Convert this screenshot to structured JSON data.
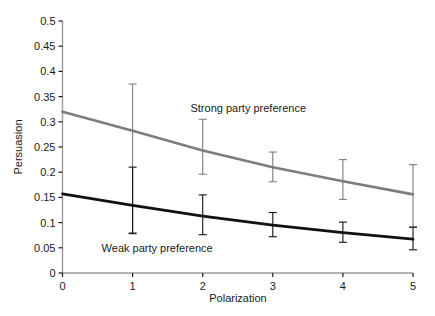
{
  "chart_data": {
    "type": "line",
    "title": "",
    "subtitle": "",
    "xlabel": "Polarization",
    "ylabel": "Persuasion",
    "x": [
      0,
      1,
      2,
      3,
      4,
      5
    ],
    "xlim": [
      0,
      5
    ],
    "ylim": [
      0,
      0.5
    ],
    "xticks": [
      "0",
      "1",
      "2",
      "3",
      "4",
      "5"
    ],
    "yticks": [
      "0",
      "0.05",
      "0.1",
      "0.15",
      "0.2",
      "0.25",
      "0.3",
      "0.35",
      "0.4",
      "0.45",
      "0.5"
    ],
    "ytick_values": [
      0,
      0.05,
      0.1,
      0.15,
      0.2,
      0.25,
      0.3,
      0.35,
      0.4,
      0.45,
      0.5
    ],
    "grid": false,
    "legend_position": "inline-annotation",
    "series": [
      {
        "name": "Strong party preference",
        "color": "#7d7d7d",
        "line_width": 2.6,
        "values": [
          0.32,
          0.282,
          0.243,
          0.21,
          0.182,
          0.156
        ],
        "errorbars": [
          {
            "x": 1,
            "low": 0.08,
            "high": 0.375
          },
          {
            "x": 2,
            "low": 0.196,
            "high": 0.305
          },
          {
            "x": 3,
            "low": 0.181,
            "high": 0.24
          },
          {
            "x": 4,
            "low": 0.146,
            "high": 0.225
          },
          {
            "x": 5,
            "low": 0.091,
            "high": 0.215
          }
        ],
        "annotation": {
          "text": "Strong party preference",
          "x": 2.65,
          "y": 0.327
        }
      },
      {
        "name": "Weak party preference",
        "color": "#111111",
        "line_width": 2.8,
        "values": [
          0.157,
          0.134,
          0.113,
          0.095,
          0.08,
          0.067
        ],
        "errorbars": [
          {
            "x": 1,
            "low": 0.078,
            "high": 0.21
          },
          {
            "x": 2,
            "low": 0.076,
            "high": 0.155
          },
          {
            "x": 3,
            "low": 0.072,
            "high": 0.12
          },
          {
            "x": 4,
            "low": 0.061,
            "high": 0.101
          },
          {
            "x": 5,
            "low": 0.046,
            "high": 0.091
          }
        ],
        "annotation": {
          "text": "Weak party preference",
          "x": 1.35,
          "y": 0.049
        }
      }
    ],
    "axis_color": "#9a9a9a",
    "tick_color": "#1a1a1a",
    "background": "#ffffff"
  }
}
